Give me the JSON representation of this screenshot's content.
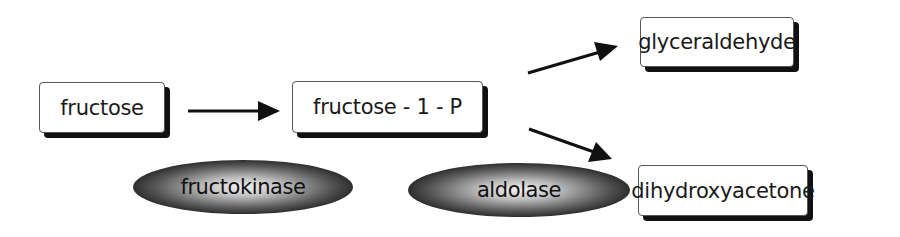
{
  "diagram": {
    "nodes": {
      "fructose": "fructose",
      "fructose_1_p": "fructose - 1 - P",
      "glyceraldehyde": "glyceraldehyde",
      "dihydroxyacetone": "dihydroxyacetone"
    },
    "enzymes": {
      "fructokinase": "fructokinase",
      "aldolase": "aldolase"
    },
    "edges": [
      {
        "from": "fructose",
        "to": "fructose - 1 - P",
        "enzyme": "fructokinase"
      },
      {
        "from": "fructose - 1 - P",
        "to": "glyceraldehyde",
        "enzyme": "aldolase"
      },
      {
        "from": "fructose - 1 - P",
        "to": "dihydroxyacetone",
        "enzyme": "aldolase"
      }
    ],
    "colors": {
      "box_border": "#555555",
      "box_shadow": "#111111",
      "arrow": "#111111",
      "enzyme_center": "#f2f2f2",
      "enzyme_edge": "#050505"
    }
  }
}
